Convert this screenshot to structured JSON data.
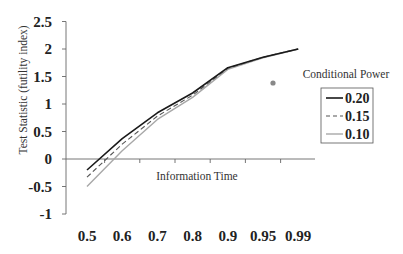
{
  "chart_data": {
    "type": "line",
    "title": "",
    "xlabel": "Information Time",
    "ylabel": "Test Statistic (futility index)",
    "categories": [
      "0.5",
      "0.6",
      "0.7",
      "0.8",
      "0.9",
      "0.95",
      "0.99"
    ],
    "ylim": [
      -1,
      2.5
    ],
    "yticks": [
      "2.5",
      "2",
      "1.5",
      "1",
      "0.5",
      "0",
      "-0.5",
      "-1"
    ],
    "grid": false,
    "legend_title": "Conditional Power",
    "legend_position": "right",
    "series": [
      {
        "name": "0.20",
        "style": "solid",
        "color": "#1a1a1a",
        "values": [
          -0.2,
          0.37,
          0.84,
          1.2,
          1.66,
          1.85,
          2.0
        ]
      },
      {
        "name": "0.15",
        "style": "dashed",
        "color": "#555555",
        "values": [
          -0.33,
          0.27,
          0.78,
          1.16,
          1.65,
          1.85,
          2.0
        ]
      },
      {
        "name": "0.10",
        "style": "solid-light",
        "color": "#a8a8a8",
        "values": [
          -0.5,
          0.15,
          0.72,
          1.12,
          1.63,
          1.84,
          2.0
        ]
      }
    ],
    "annotations": [
      {
        "type": "dot",
        "x_px": 273,
        "y_px": 83,
        "color": "#888888"
      }
    ]
  }
}
